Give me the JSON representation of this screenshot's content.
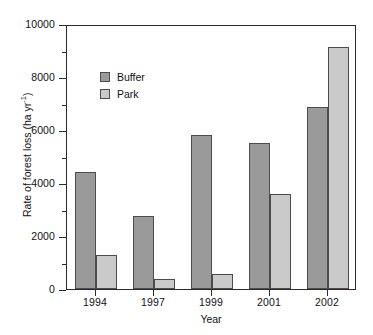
{
  "chart_data": {
    "type": "bar",
    "title": "",
    "xlabel": "Year",
    "ylabel": "Rate of forest loss (ha yr",
    "ylabel_exponent": "-1",
    "ylabel_suffix": ")",
    "categories": [
      "1994",
      "1997",
      "1999",
      "2001",
      "2002"
    ],
    "series": [
      {
        "name": "Buffer",
        "color": "#9a9a9a",
        "values": [
          4400,
          2750,
          5800,
          5500,
          6850
        ]
      },
      {
        "name": "Park",
        "color": "#cacaca",
        "values": [
          1280,
          380,
          570,
          3580,
          9150
        ]
      }
    ],
    "ylim": [
      0,
      10000
    ],
    "yticks": [
      0,
      2000,
      4000,
      6000,
      8000,
      10000
    ],
    "ytick_labels": [
      "0",
      "2000",
      "4000",
      "6000",
      "8000",
      "10000"
    ],
    "yminor_interval": 1000,
    "grid": false,
    "legend_position": "upper-left-inside",
    "bar_edge_color": "#4c4c4c",
    "axis_color": "#2b2b2b",
    "background": "#ffffff"
  }
}
